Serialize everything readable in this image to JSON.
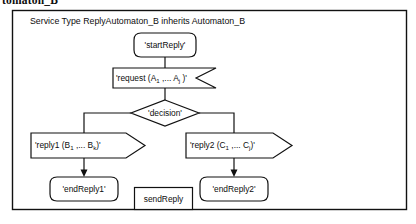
{
  "page": {
    "cut_off_heading": "tomaton_B",
    "width": 416,
    "height": 224,
    "stroke_color": "#111111",
    "background_color": "#ffffff"
  },
  "diagram": {
    "frame_label": "Service Type ReplyAutomaton_B inherits Automaton_B",
    "nodes": {
      "start": {
        "label": "'startReply'",
        "shape": "rounded-terminator"
      },
      "request": {
        "label_prefix": "'request (A",
        "sub1": "1",
        "label_mid": " ,... A",
        "sub2": "j",
        "label_suffix": " )'",
        "shape": "notched-input"
      },
      "decision": {
        "label": "'decision'",
        "shape": "diamond"
      },
      "reply1": {
        "label_prefix": "'reply1 (B",
        "sub1": "1",
        "label_mid": " ,... B",
        "sub2": "k",
        "label_suffix": ")'",
        "shape": "arrow-pentagon"
      },
      "reply2": {
        "label_prefix": "'reply2 (C",
        "sub1": "1",
        "label_mid": " ,... C",
        "sub2": "j",
        "label_suffix": ")'",
        "shape": "arrow-pentagon"
      },
      "end1": {
        "label": "'endReply1'",
        "shape": "rounded-terminator"
      },
      "end2": {
        "label": "'endReply2'",
        "shape": "rounded-terminator"
      },
      "sendreply": {
        "label": "sendReply",
        "shape": "rectangle"
      }
    }
  }
}
